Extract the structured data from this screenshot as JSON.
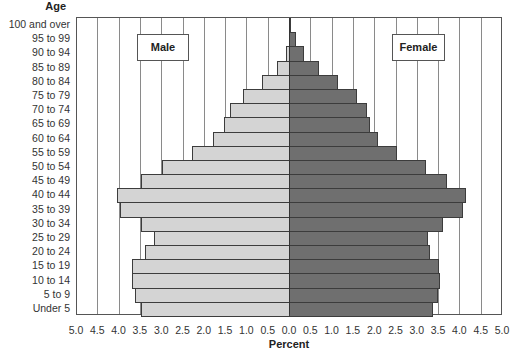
{
  "chart_data": {
    "type": "bar",
    "orientation": "horizontal",
    "subtype": "population-pyramid",
    "title": "",
    "ylabel": "Age",
    "xlabel": "Percent",
    "xlim": [
      -5.0,
      5.0
    ],
    "x_ticks": [
      "5.0",
      "4.5",
      "4.0",
      "3.5",
      "3.0",
      "2.5",
      "2.0",
      "1.5",
      "1.0",
      "0.5",
      "0.0",
      "0.5",
      "1.0",
      "1.5",
      "2.0",
      "2.5",
      "3.0",
      "3.5",
      "4.0",
      "4.5",
      "5.0"
    ],
    "grid": true,
    "legend_labels": {
      "male": "Male",
      "female": "Female"
    },
    "categories": [
      "100 and over",
      "95 to 99",
      "90 to 94",
      "85 to 89",
      "80 to 84",
      "75 to 79",
      "70 to 74",
      "65 to 69",
      "60 to 64",
      "55 to 59",
      "50 to 54",
      "45 to 49",
      "40 to 44",
      "35 to 39",
      "30 to 34",
      "25 to 29",
      "20 to 24",
      "15 to 19",
      "10 to 14",
      "5 to 9",
      "Under 5"
    ],
    "series": [
      {
        "name": "Male",
        "color": "#d4d4d4",
        "values": [
          0.0,
          0.02,
          0.1,
          0.3,
          0.65,
          1.1,
          1.4,
          1.55,
          1.8,
          2.3,
          3.0,
          3.5,
          4.05,
          4.0,
          3.5,
          3.2,
          3.4,
          3.7,
          3.7,
          3.65,
          3.5
        ]
      },
      {
        "name": "Female",
        "color": "#6f6f6f",
        "values": [
          0.03,
          0.13,
          0.34,
          0.68,
          1.13,
          1.58,
          1.8,
          1.88,
          2.07,
          2.5,
          3.2,
          3.68,
          4.14,
          4.07,
          3.59,
          3.25,
          3.28,
          3.49,
          3.51,
          3.48,
          3.35
        ]
      }
    ]
  }
}
